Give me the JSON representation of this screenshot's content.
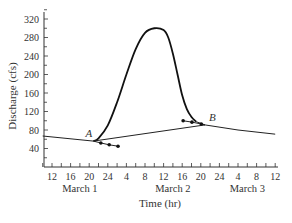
{
  "chart_data": {
    "type": "line",
    "title": "",
    "xlabel": "Time (hr)",
    "ylabel": "Discharge (cfs)",
    "ylim": [
      0,
      340
    ],
    "yticks": [
      40,
      80,
      120,
      160,
      200,
      240,
      280,
      320
    ],
    "xlim_hours": [
      -2,
      50
    ],
    "xtick_labels": [
      "12",
      "16",
      "20",
      "24",
      "4",
      "8",
      "12",
      "16",
      "20",
      "24",
      "4",
      "8",
      "12"
    ],
    "xtick_hours": [
      0,
      4,
      8,
      12,
      16,
      20,
      24,
      28,
      32,
      36,
      40,
      44,
      48
    ],
    "day_labels": [
      {
        "label": "March 1",
        "hour": 6
      },
      {
        "label": "March 2",
        "hour": 26
      },
      {
        "label": "March 3",
        "hour": 42
      }
    ],
    "grid": false,
    "series": [
      {
        "name": "Hydrograph",
        "points": [
          [
            -2,
            67
          ],
          [
            8.9,
            56
          ],
          [
            10,
            62
          ],
          [
            12,
            90
          ],
          [
            14,
            140
          ],
          [
            16,
            200
          ],
          [
            18,
            255
          ],
          [
            20,
            290
          ],
          [
            22,
            300
          ],
          [
            24,
            296
          ],
          [
            25,
            280
          ],
          [
            26,
            245
          ],
          [
            27,
            200
          ],
          [
            28,
            155
          ],
          [
            29,
            125
          ],
          [
            30,
            108
          ],
          [
            31,
            98
          ],
          [
            32.9,
            91
          ],
          [
            40,
            80
          ],
          [
            48,
            71
          ]
        ]
      },
      {
        "name": "Baseflow separation line",
        "points": [
          [
            8.9,
            56
          ],
          [
            32.9,
            91
          ]
        ]
      },
      {
        "name": "Recession after A (dots)",
        "points": [
          [
            10.5,
            52
          ],
          [
            12.3,
            48
          ],
          [
            14.2,
            45
          ]
        ]
      },
      {
        "name": "Recession before B (dots)",
        "points": [
          [
            28.2,
            100
          ],
          [
            30.1,
            97
          ],
          [
            32.1,
            93
          ]
        ]
      }
    ],
    "annotations": [
      {
        "text": "A",
        "hour": 8.9,
        "value": 56
      },
      {
        "text": "B",
        "hour": 32.9,
        "value": 91
      }
    ]
  }
}
